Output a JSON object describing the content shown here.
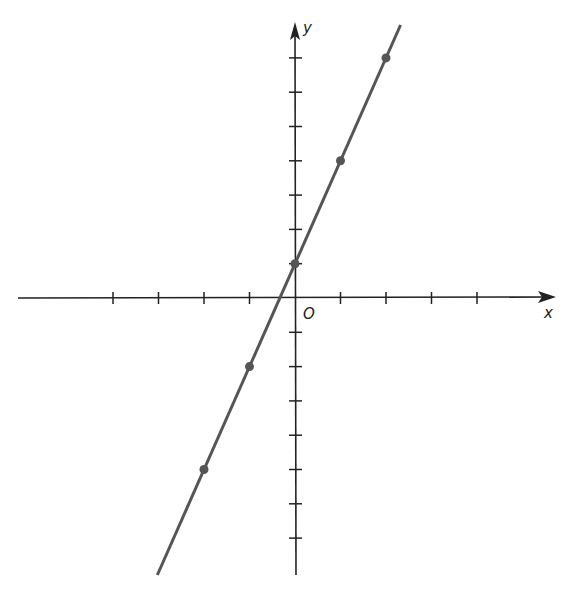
{
  "chart_data": {
    "type": "line",
    "title": "",
    "xlabel": "x",
    "ylabel": "y",
    "origin_label": "O",
    "equation": "y = 3x + 1",
    "xlim": [
      -6,
      6
    ],
    "ylim": [
      -8,
      8
    ],
    "x_ticks": [
      -4,
      -3,
      -2,
      -1,
      1,
      2,
      3,
      4
    ],
    "y_ticks": [
      -7,
      -6,
      -5,
      -4,
      -3,
      -2,
      -1,
      1,
      2,
      3,
      4,
      5,
      6,
      7
    ],
    "tick_labels_shown": false,
    "grid": false,
    "legend": null,
    "series": [
      {
        "name": "line",
        "points": [
          {
            "x": -2,
            "y": -5
          },
          {
            "x": -1,
            "y": -2
          },
          {
            "x": 0,
            "y": 1
          },
          {
            "x": 1,
            "y": 4
          },
          {
            "x": 2,
            "y": 7
          }
        ]
      }
    ],
    "colors": {
      "axis": "#222222",
      "line": "#555555",
      "points": "#555555"
    }
  }
}
